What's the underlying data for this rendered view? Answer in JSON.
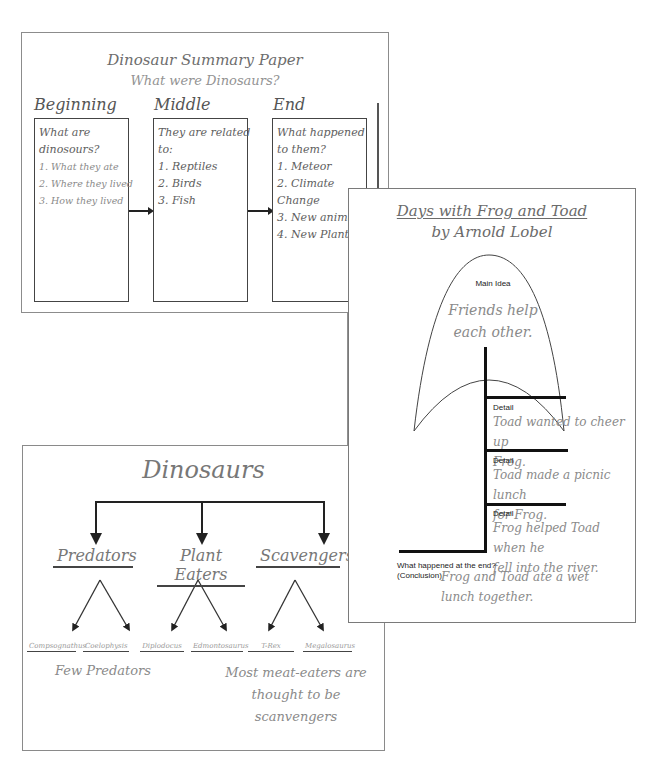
{
  "summary_paper": {
    "title": "Dinosaur Summary Paper",
    "subtitle": "What were Dinosaurs?",
    "columns": [
      {
        "heading": "Beginning",
        "lines": [
          "What are",
          "dinosours?",
          "1. What they ate",
          "2. Where they lived",
          "3. How they lived"
        ]
      },
      {
        "heading": "Middle",
        "lines": [
          "They are related",
          "to:",
          "1. Reptiles",
          "2. Birds",
          "3. Fish"
        ]
      },
      {
        "heading": "End",
        "lines": [
          "What happened",
          "to them?",
          "1. Meteor",
          "2. Climate",
          "Change",
          "3. New animals",
          "4. New Plants"
        ]
      }
    ]
  },
  "frog_toad": {
    "title": "Days with Frog and Toad",
    "author": "by Arnold Lobel",
    "main_idea_label": "Main Idea",
    "main_idea_lines": [
      "Friends help",
      "each other."
    ],
    "details": [
      {
        "label": "Detail",
        "lines": [
          "Toad wanted to cheer up",
          "Frog."
        ]
      },
      {
        "label": "Detail",
        "lines": [
          "Toad made a picnic lunch",
          "for Frog."
        ]
      },
      {
        "label": "Detail",
        "lines": [
          "Frog helped Toad when he",
          "fell into the river."
        ]
      }
    ],
    "conclusion_label_1": "What happened at the end?",
    "conclusion_label_2": "(Conclusion)",
    "conclusion_lines": [
      "Frog and Toad ate a wet",
      "lunch together."
    ]
  },
  "dinosaurs_chart": {
    "title": "Dinosaurs",
    "categories": [
      {
        "name": "Predators",
        "examples": [
          "Compsognathus",
          "Coelophysis"
        ]
      },
      {
        "name": "Plant Eaters",
        "examples": [
          "Diplodocus",
          "Edmontosaurus"
        ]
      },
      {
        "name": "Scavengers",
        "examples": [
          "T-Rex",
          "Megalosaurus"
        ]
      }
    ],
    "note_left": "Few Predators",
    "note_right_lines": [
      "Most meat-eaters are",
      "thought to be scanvengers"
    ]
  },
  "colors": {
    "page_border": "#8c8c8c",
    "handwriting_gray": "#8a8a8a",
    "line_dark": "#222222"
  }
}
